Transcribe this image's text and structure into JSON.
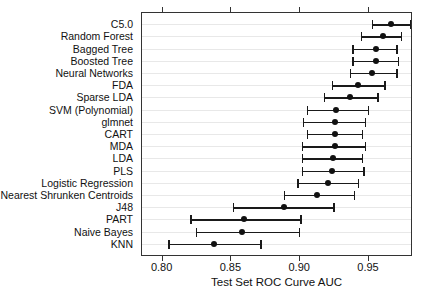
{
  "chart_data": {
    "type": "scatter",
    "orientation": "horizontal",
    "title": "",
    "xlabel": "Test Set ROC Curve AUC",
    "ylabel": "",
    "xlim": [
      0.785,
      0.982
    ],
    "xticks": [
      0.8,
      0.85,
      0.9,
      0.95
    ],
    "xticklabels": [
      "0.80",
      "0.85",
      "0.90",
      "0.95"
    ],
    "grid": "horizontal",
    "legend": "none",
    "categories": [
      "C5.0",
      "Random Forest",
      "Bagged Tree",
      "Boosted Tree",
      "Neural Networks",
      "FDA",
      "Sparse LDA",
      "SVM (Polynomial)",
      "glmnet",
      "CART",
      "MDA",
      "LDA",
      "PLS",
      "Logistic Regression",
      "Nearest Shrunken Centroids",
      "J48",
      "PART",
      "Naive Bayes",
      "KNN"
    ],
    "values": [
      0.966,
      0.96,
      0.955,
      0.955,
      0.952,
      0.942,
      0.936,
      0.926,
      0.925,
      0.925,
      0.925,
      0.924,
      0.923,
      0.92,
      0.912,
      0.888,
      0.859,
      0.858,
      0.837
    ],
    "ci_low": [
      0.952,
      0.944,
      0.938,
      0.938,
      0.936,
      0.923,
      0.917,
      0.905,
      0.902,
      0.905,
      0.901,
      0.901,
      0.901,
      0.898,
      0.888,
      0.851,
      0.82,
      0.824,
      0.804
    ],
    "ci_high": [
      0.98,
      0.973,
      0.97,
      0.971,
      0.97,
      0.961,
      0.956,
      0.949,
      0.947,
      0.945,
      0.947,
      0.945,
      0.946,
      0.942,
      0.939,
      0.924,
      0.9,
      0.899,
      0.871
    ],
    "series": [
      {
        "name": "Test Set ROC Curve AUC",
        "marker": "filled-circle",
        "error_bars": "confidence-interval"
      }
    ],
    "colors": {
      "marker": "#111111",
      "line": "#1a1a1a",
      "grid": "#e8e8e8",
      "frame": "#333333"
    }
  }
}
